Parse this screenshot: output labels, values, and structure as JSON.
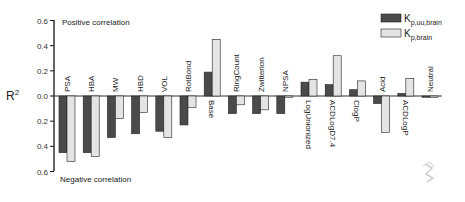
{
  "chart_data": {
    "type": "bar",
    "title": "",
    "xlabel": "",
    "ylabel": "R2",
    "ylim": [
      -0.6,
      0.6
    ],
    "yticks": [
      "0.6",
      "0.4",
      "0.2",
      "0.0",
      "0.2",
      "0.4",
      "0.6"
    ],
    "ytick_values": [
      0.6,
      0.4,
      0.2,
      0.0,
      -0.2,
      -0.4,
      -0.6
    ],
    "grid": false,
    "legend_position": "top-right",
    "annotations": {
      "top": "Positive correlation",
      "bottom": "Negative correlation"
    },
    "categories": [
      "PSA",
      "HBA",
      "MW",
      "HBD",
      "VOL",
      "RotBond",
      "Base",
      "RingCount",
      "Zwitterion",
      "NPSA",
      "LogUnionized",
      "ACDLogD7.4",
      "ClogP",
      "Acid",
      "ACDLogP",
      "Neutral"
    ],
    "series": [
      {
        "name": "Kp,uu,brain",
        "legend_main": "K",
        "legend_sub": "p,uu,brain",
        "color": "#4a4a4a",
        "values": [
          -0.45,
          -0.45,
          -0.33,
          -0.3,
          -0.28,
          -0.23,
          0.19,
          -0.14,
          -0.14,
          -0.14,
          0.11,
          0.09,
          0.05,
          -0.06,
          0.02,
          -0.01
        ]
      },
      {
        "name": "Kp,brain",
        "legend_main": "K",
        "legend_sub": "p,brain",
        "color": "#e4e4e4",
        "values": [
          -0.52,
          -0.48,
          -0.18,
          -0.13,
          -0.33,
          -0.09,
          0.45,
          -0.07,
          -0.11,
          -0.01,
          0.13,
          0.32,
          0.12,
          -0.29,
          0.14,
          -0.01
        ]
      }
    ],
    "label_side": [
      "top",
      "top",
      "top",
      "top",
      "top",
      "top",
      "bottom",
      "top",
      "top",
      "top",
      "bottom",
      "bottom",
      "bottom",
      "top",
      "bottom",
      "top"
    ]
  }
}
